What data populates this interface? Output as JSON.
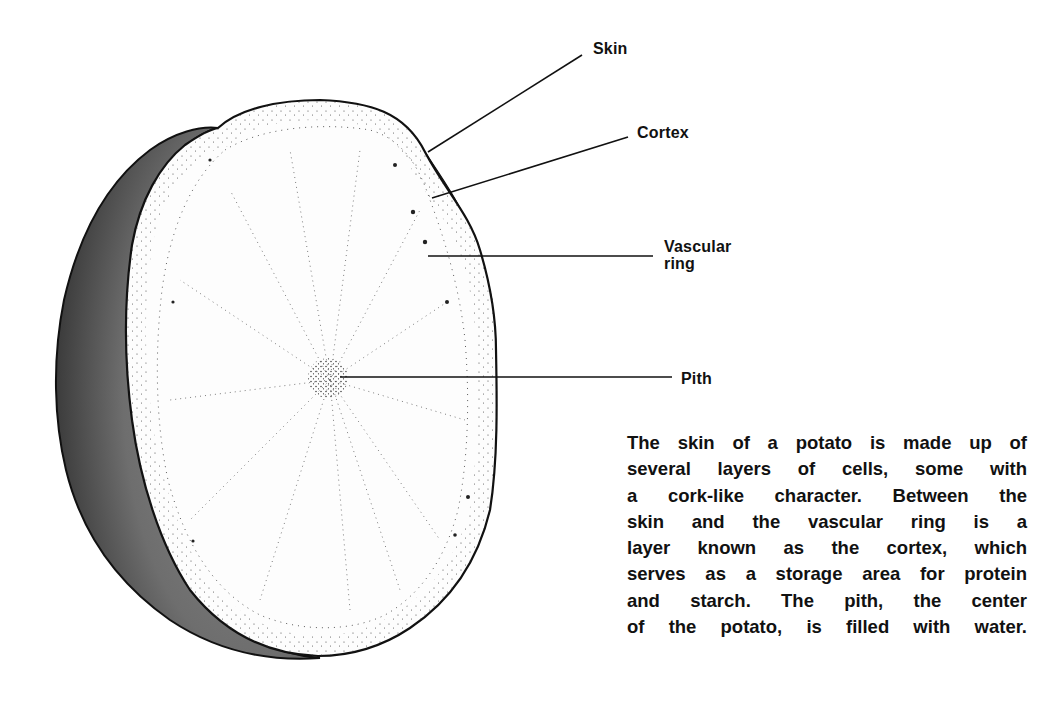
{
  "figure": {
    "colors": {
      "background": "#ffffff",
      "outline": "#111111",
      "skin_shade": "#7a7a7a",
      "skin_dark": "#2a2a2a",
      "flesh": "#fdfdfd",
      "stipple": "#222222"
    }
  },
  "labels": {
    "skin": "Skin",
    "cortex": "Cortex",
    "vascular_ring_line1": "Vascular",
    "vascular_ring_line2": "ring",
    "pith": "Pith"
  },
  "caption": {
    "lines": [
      "The skin of a potato is made up of",
      "several layers of cells, some with",
      "a cork-like character. Between the",
      "skin and the vascular ring is a",
      "layer known as the cortex, which",
      "serves as a storage area for protein",
      "and starch. The pith, the center",
      "of the potato, is filled with water."
    ]
  }
}
